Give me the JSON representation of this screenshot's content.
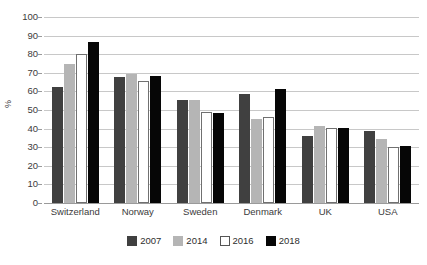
{
  "chart_data": {
    "type": "bar",
    "title": "",
    "subtitle": "",
    "xlabel": "",
    "ylabel": "%",
    "ylim": [
      0,
      100
    ],
    "ytick_step": 10,
    "yticks": [
      100,
      90,
      80,
      70,
      60,
      50,
      40,
      30,
      20,
      10,
      0
    ],
    "grid": true,
    "legend_position": "bottom",
    "categories": [
      "Switzerland",
      "Norway",
      "Sweden",
      "Denmark",
      "UK",
      "USA"
    ],
    "series": [
      {
        "name": "2007",
        "color": "#404040",
        "values": [
          62.5,
          67.5,
          55.5,
          58.5,
          36.0,
          38.5
        ]
      },
      {
        "name": "2014",
        "color": "#b5b5b5",
        "values": [
          75.0,
          69.5,
          55.5,
          45.0,
          41.5,
          34.5
        ]
      },
      {
        "name": "2016",
        "color": "#ffffff",
        "values": [
          80.0,
          65.5,
          49.0,
          46.5,
          40.5,
          30.0
        ]
      },
      {
        "name": "2018",
        "color": "#060606",
        "values": [
          86.5,
          68.5,
          48.5,
          61.5,
          40.5,
          30.5
        ]
      }
    ]
  }
}
